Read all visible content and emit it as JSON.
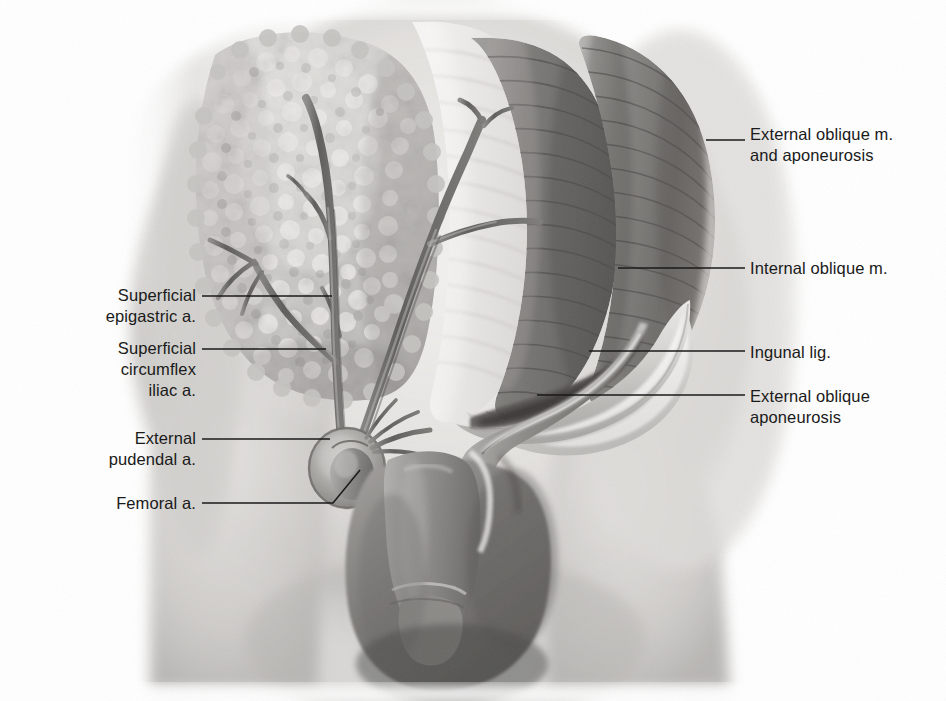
{
  "figure": {
    "width": 946,
    "height": 701,
    "background": "#ffffff",
    "ink_color": "#1a1a1a",
    "label_font_size_px": 16.5
  },
  "labels": {
    "external_oblique_m_and_aponeurosis": {
      "text": "External oblique m.\nand aponeurosis",
      "side": "right",
      "text_x": 750,
      "text_y": 124,
      "leader": {
        "x1": 745,
        "y1": 140,
        "x2": 706,
        "y2": 140
      }
    },
    "internal_oblique_m": {
      "text": "Internal oblique m.",
      "side": "right",
      "text_x": 750,
      "text_y": 258,
      "leader": {
        "x1": 745,
        "y1": 268,
        "x2": 618,
        "y2": 268
      }
    },
    "ingunal_lig": {
      "text": "Ingunal lig.",
      "side": "right",
      "text_x": 750,
      "text_y": 342,
      "leader": {
        "x1": 745,
        "y1": 351,
        "x2": 589,
        "y2": 351
      }
    },
    "external_oblique_aponeurosis": {
      "text": "External oblique\naponeurosis",
      "side": "right",
      "text_x": 750,
      "text_y": 386,
      "leader": {
        "x1": 745,
        "y1": 395,
        "x2": 537,
        "y2": 395
      }
    },
    "superficial_epigastric_a": {
      "text": "Superficial\nepigastric a.",
      "side": "left",
      "text_right": 196,
      "text_y": 285,
      "leader": {
        "x1": 202,
        "y1": 296,
        "x2": 332,
        "y2": 296
      }
    },
    "superficial_circumflex_iliac_a": {
      "text": "Superficial\ncircumflex\niliac a.",
      "side": "left",
      "text_right": 196,
      "text_y": 338,
      "leader": {
        "x1": 202,
        "y1": 349,
        "x2": 326,
        "y2": 349
      }
    },
    "external_pudendal_a": {
      "text": "External\npudendal a.",
      "side": "left",
      "text_right": 196,
      "text_y": 428,
      "leader": {
        "x1": 202,
        "y1": 439,
        "x2": 330,
        "y2": 439
      }
    },
    "femoral_a": {
      "text": "Femoral a.",
      "side": "left",
      "text_right": 196,
      "text_y": 493,
      "leader_polyline": "202,503 333,503 360,470"
    }
  },
  "structures": {
    "fatty_tissue_pad": "Superficial fatty (Camper's) layer reflected, lobulated",
    "fossa_ovalis": "Saphenous opening / fossa ovalis ring",
    "femoral_artery_stump": "Cut femoral artery",
    "scrotum": "Scrotum and spermatic cord",
    "abdominal_fascia": "Fascial sheet with oblique fibers"
  },
  "palette": {
    "skin_light": "#e9e8e6",
    "skin_mid": "#c9c7c4",
    "skin_shadow": "#9a9895",
    "muscle_dark": "#6e6c6a",
    "muscle_mid": "#8d8b88",
    "vessel": "#6b6866",
    "fat_light": "#dedcd9",
    "fat_shadow": "#a8a6a3",
    "deep_shadow": "#5a5856",
    "ink": "#1a1a1a"
  }
}
